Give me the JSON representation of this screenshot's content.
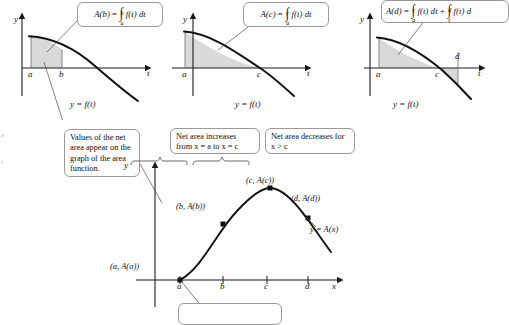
{
  "figure": {
    "background": "#fefefe",
    "ink": "#1a1a1a",
    "shade": "#d9d9d9"
  },
  "panels": [
    {
      "id": "panel-b",
      "formula_text": "A(b) = ∫_a^b f(t) dt",
      "formula_lhs": "A(b)",
      "formula_eq": "=",
      "formula_upper": "b",
      "formula_lower": "a",
      "formula_body": "f(t) dt",
      "y_axis_label": "y",
      "t_axis_label": "t",
      "tick_labels": [
        "a",
        "b"
      ],
      "curve_label": "y = f(t)",
      "shaded_from": "a",
      "shaded_to": "b"
    },
    {
      "id": "panel-c",
      "formula_text": "A(c) = ∫_a^c f(t) dt",
      "formula_lhs": "A(c)",
      "formula_eq": "=",
      "formula_upper": "c",
      "formula_lower": "a",
      "formula_body": "f(t) dt",
      "y_axis_label": "y",
      "t_axis_label": "t",
      "tick_labels": [
        "a",
        "c"
      ],
      "curve_label": "y = f(t)",
      "shaded_from": "a",
      "shaded_to": "c"
    },
    {
      "id": "panel-d",
      "formula_text": "A(d) = ∫_a^c f(t) dt + ∫_c^d f(t) dt",
      "formula_lhs": "A(d)",
      "formula_eq": "=",
      "formula_upper": "c",
      "formula_lower": "a",
      "formula_body": "f(t) dt",
      "formula_plus": "+",
      "formula_upper2": "d",
      "formula_lower2": "c",
      "formula_body2": "f(t) d",
      "y_axis_label": "y",
      "t_axis_label": "t",
      "tick_labels": [
        "a",
        "c",
        "d"
      ],
      "curve_label": "y = f(t)",
      "shaded_from": "a",
      "shaded_to": "d"
    }
  ],
  "callouts": {
    "net_area_values": "Values of the net area appear on the graph of the area function.",
    "increases": "Net area increases from x = a to x = c",
    "decreases": "Net area decreases for x > c",
    "cut_off_bottom": ""
  },
  "main_graph": {
    "y_axis_label": "y",
    "x_axis_label": "x",
    "curve_label": "y = A(x)",
    "tick_labels": [
      "a",
      "b",
      "c",
      "d"
    ],
    "points": [
      {
        "name": "point-a",
        "label": "(a, A(a))"
      },
      {
        "name": "point-b",
        "label": "(b, A(b))"
      },
      {
        "name": "point-c",
        "label": "(c, A(c))"
      },
      {
        "name": "point-d",
        "label": "(d, A(d))"
      }
    ]
  },
  "margin_marks": {
    "left_top": "e",
    "left_bottom": "t"
  }
}
